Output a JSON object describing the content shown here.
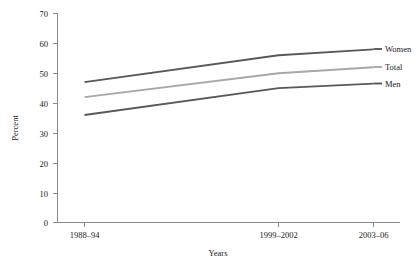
{
  "chart_data": {
    "type": "line",
    "title": "",
    "xlabel": "Years",
    "ylabel": "Percent",
    "categories": [
      "1988–94",
      "1999–2002",
      "2003–06"
    ],
    "ylim": [
      0,
      70
    ],
    "yticks": [
      0,
      10,
      20,
      30,
      40,
      50,
      60,
      70
    ],
    "ytick_labels": [
      "0",
      "10",
      "20",
      "30",
      "40",
      "50",
      "60",
      "70"
    ],
    "grid": false,
    "legend_position": "right-inline-labels",
    "series": [
      {
        "name": "Women",
        "values": [
          47,
          56,
          58
        ],
        "color": "#595959"
      },
      {
        "name": "Total",
        "values": [
          42,
          50,
          52
        ],
        "color": "#a8a8a8"
      },
      {
        "name": "Men",
        "values": [
          36,
          45,
          46.5
        ],
        "color": "#595959"
      }
    ]
  },
  "axes": {
    "y_title": "Percent",
    "x_title": "Years",
    "y_tick_0": "0",
    "y_tick_10": "10",
    "y_tick_20": "20",
    "y_tick_30": "30",
    "y_tick_40": "40",
    "y_tick_50": "50",
    "y_tick_60": "60",
    "y_tick_70": "70",
    "x_tick_1": "1988–94",
    "x_tick_2": "1999–2002",
    "x_tick_3": "2003–06"
  },
  "labels": {
    "women": "Women",
    "total": "Total",
    "men": "Men"
  },
  "colors": {
    "dark_series": "#595959",
    "light_series": "#a8a8a8",
    "axis": "#8a8a8a",
    "text": "#1a1a1a",
    "background": "#ffffff"
  }
}
